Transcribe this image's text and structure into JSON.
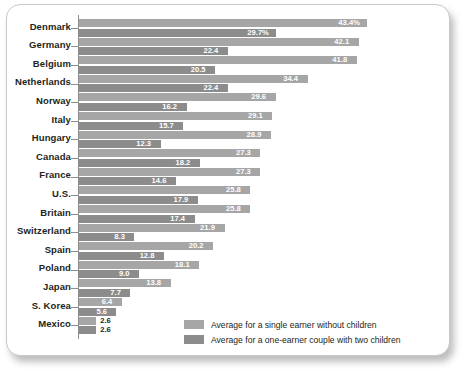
{
  "chart_data": {
    "type": "bar",
    "orientation": "horizontal",
    "title": "",
    "subtitle": "",
    "xlabel": "",
    "ylabel": "",
    "xlim": [
      0,
      45
    ],
    "grid": false,
    "legend_position": "bottom-right",
    "unit": "%",
    "categories": [
      "Denmark",
      "Germany",
      "Belgium",
      "Netherlands",
      "Norway",
      "Italy",
      "Hungary",
      "Canada",
      "France",
      "U.S.",
      "Britain",
      "Switzerland",
      "Spain",
      "Poland",
      "Japan",
      "S. Korea",
      "Mexico"
    ],
    "series": [
      {
        "name": "Average for a single earner without children",
        "color": "#a6a6a6",
        "values": [
          43.4,
          42.1,
          41.8,
          34.4,
          29.6,
          29.1,
          28.9,
          27.3,
          27.3,
          25.8,
          25.8,
          21.9,
          20.2,
          18.1,
          13.8,
          6.4,
          2.6
        ],
        "labels": [
          "43.4%",
          "42.1",
          "41.8",
          "34.4",
          "29.6",
          "29.1",
          "28.9",
          "27.3",
          "27.3",
          "25.8",
          "25.8",
          "21.9",
          "20.2",
          "18.1",
          "13.8",
          "6.4",
          "2.6"
        ]
      },
      {
        "name": "Average for a one-earner couple with two children",
        "color": "#8c8c8c",
        "values": [
          29.7,
          22.4,
          20.5,
          22.4,
          16.2,
          15.7,
          12.3,
          18.2,
          14.6,
          17.9,
          17.4,
          8.3,
          12.8,
          9.0,
          7.7,
          5.6,
          2.6
        ],
        "labels": [
          "29.7%",
          "22.4",
          "20.5",
          "22.4",
          "16.2",
          "15.7",
          "12.3",
          "18.2",
          "14.6",
          "17.9",
          "17.4",
          "8.3",
          "12.8",
          "9.0",
          "7.7",
          "5.6",
          "2.6"
        ]
      }
    ]
  },
  "legend": {
    "items": [
      {
        "label": "Average for a single earner without children",
        "color": "#a6a6a6"
      },
      {
        "label": "Average for a one-earner couple with two children",
        "color": "#8c8c8c"
      }
    ]
  }
}
